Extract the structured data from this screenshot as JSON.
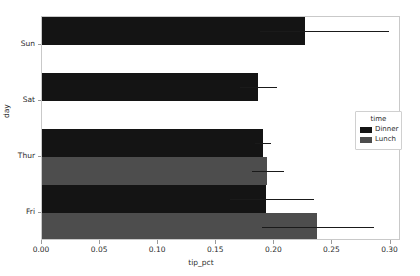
{
  "chart_data": {
    "type": "bar",
    "orientation": "horizontal",
    "title": "",
    "xlabel": "tip_pct",
    "ylabel": "day",
    "xlim": [
      0.0,
      0.309
    ],
    "grid": false,
    "legend_title": "time",
    "legend_position": "center right",
    "categories": [
      "Sun",
      "Sat",
      "Thur",
      "Fri"
    ],
    "xticks": [
      "0.00",
      "0.05",
      "0.10",
      "0.15",
      "0.20",
      "0.25",
      "0.30"
    ],
    "xtick_values": [
      0.0,
      0.05,
      0.1,
      0.15,
      0.2,
      0.25,
      0.3
    ],
    "series": [
      {
        "name": "Dinner",
        "color": "#141414",
        "values": [
          0.226,
          0.186,
          0.19,
          0.193
        ],
        "err_low": [
          0.188,
          0.17,
          0.183,
          0.162
        ],
        "err_high": [
          0.299,
          0.202,
          0.197,
          0.234
        ],
        "present": [
          true,
          true,
          true,
          true
        ]
      },
      {
        "name": "Lunch",
        "color": "#4d4d4d",
        "values": [
          null,
          null,
          0.194,
          0.237
        ],
        "err_low": [
          null,
          null,
          0.181,
          0.189
        ],
        "err_high": [
          null,
          null,
          0.208,
          0.286
        ],
        "present": [
          false,
          false,
          true,
          true
        ]
      }
    ]
  },
  "axes": {
    "ylabel": "day",
    "xlabel": "tip_pct",
    "ytick_labels": [
      "Sun",
      "Sat",
      "Thur",
      "Fri"
    ],
    "xtick_labels": [
      "0.00",
      "0.05",
      "0.10",
      "0.15",
      "0.20",
      "0.25",
      "0.30"
    ]
  },
  "legend": {
    "title": "time",
    "entries": [
      {
        "label": "Dinner",
        "color": "#141414"
      },
      {
        "label": "Lunch",
        "color": "#4d4d4d"
      }
    ]
  }
}
